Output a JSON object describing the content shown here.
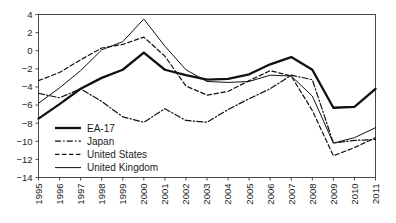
{
  "chart_data": {
    "type": "line",
    "title": "",
    "subtitle": "",
    "xlabel": "",
    "ylabel": "",
    "x": [
      1995,
      1996,
      1997,
      1998,
      1999,
      2000,
      2001,
      2002,
      2003,
      2004,
      2005,
      2006,
      2007,
      2008,
      2009,
      2010,
      2011
    ],
    "categories": [
      "1995",
      "1996",
      "1997",
      "1998",
      "1999",
      "2000",
      "2001",
      "2002",
      "2003",
      "2004",
      "2005",
      "2006",
      "2007",
      "2008",
      "2009",
      "2010",
      "2011"
    ],
    "ylim": [
      -14,
      4
    ],
    "yticks": [
      4,
      2,
      0,
      -2,
      -4,
      -6,
      -8,
      -10,
      -12,
      -14
    ],
    "ytick_labels": [
      "4",
      "2",
      "0",
      "-2",
      "-4",
      "-6",
      "-8",
      "-10",
      "-12",
      "-14"
    ],
    "grid": false,
    "legend_position": "lower-left-inside",
    "series": [
      {
        "name": "EA-17",
        "style": "solid-thick",
        "values": [
          -7.5,
          -5.9,
          -4.2,
          -3.0,
          -2.1,
          -0.2,
          -2.1,
          -2.7,
          -3.2,
          -3.1,
          -2.6,
          -1.5,
          -0.7,
          -2.1,
          -6.3,
          -6.2,
          -4.2
        ]
      },
      {
        "name": "Japan",
        "style": "dash-dot",
        "values": [
          -4.7,
          -5.2,
          -4.2,
          -5.6,
          -7.3,
          -7.9,
          -6.4,
          -7.7,
          -7.9,
          -6.5,
          -5.3,
          -4.2,
          -2.7,
          -3.2,
          -10.2,
          -9.9,
          -9.8
        ]
      },
      {
        "name": "United States",
        "style": "dashed",
        "values": [
          -3.3,
          -2.4,
          -1.0,
          0.3,
          0.7,
          1.5,
          -0.6,
          -3.9,
          -4.9,
          -4.5,
          -3.3,
          -2.2,
          -2.8,
          -6.6,
          -11.6,
          -10.7,
          -9.6
        ]
      },
      {
        "name": "United Kingdom",
        "style": "solid-thin",
        "values": [
          -5.8,
          -4.1,
          -2.2,
          0.1,
          1.0,
          3.5,
          0.5,
          -2.1,
          -3.4,
          -3.5,
          -3.4,
          -2.7,
          -2.8,
          -5.0,
          -10.2,
          -9.6,
          -8.5
        ]
      }
    ],
    "legend": [
      {
        "label": "EA-17",
        "style": "solid-thick"
      },
      {
        "label": "Japan",
        "style": "dash-dot"
      },
      {
        "label": "United States",
        "style": "dashed"
      },
      {
        "label": "United Kingdom",
        "style": "solid-thin"
      }
    ]
  },
  "colors": {
    "line": "#111111",
    "axis": "#4a4a4a",
    "text": "#1c1c1c",
    "background": "#ffffff"
  }
}
